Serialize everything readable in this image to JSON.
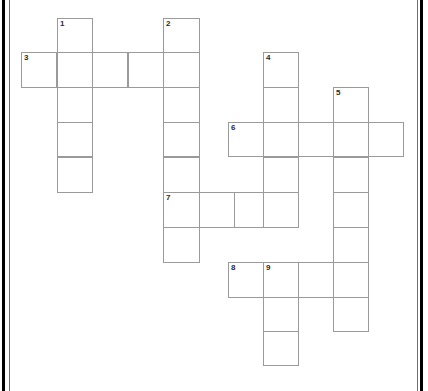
{
  "page": {
    "background_color": "#ffffff",
    "border_color": "#000000",
    "cell_border_color": "#9a9a9a",
    "number_color": "#2b2b2b",
    "width": 428,
    "height": 391
  },
  "crossword": {
    "cell_size": 35.5,
    "origin": {
      "x": 21,
      "y": 18
    },
    "clue_numbers": [
      "1",
      "2",
      "3",
      "4",
      "5",
      "6",
      "7",
      "8",
      "9"
    ],
    "entries": [
      {
        "number": "1",
        "direction": "down",
        "length": 5,
        "start": {
          "x": 57,
          "y": 18
        }
      },
      {
        "number": "2",
        "direction": "down",
        "length": 7,
        "start": {
          "x": 163,
          "y": 18
        }
      },
      {
        "number": "3",
        "direction": "across",
        "length": 5,
        "start": {
          "x": 21,
          "y": 52
        }
      },
      {
        "number": "4",
        "direction": "down",
        "length": 5,
        "start": {
          "x": 263,
          "y": 52
        }
      },
      {
        "number": "5",
        "direction": "down",
        "length": 7,
        "start": {
          "x": 333,
          "y": 87
        }
      },
      {
        "number": "6",
        "direction": "across",
        "length": 5,
        "start": {
          "x": 228,
          "y": 122
        }
      },
      {
        "number": "7",
        "direction": "across",
        "length": 4,
        "start": {
          "x": 163,
          "y": 192
        }
      },
      {
        "number": "8",
        "direction": "across",
        "length": 4,
        "start": {
          "x": 228,
          "y": 262
        }
      },
      {
        "number": "9",
        "direction": "down",
        "length": 3,
        "start": {
          "x": 263,
          "y": 262
        }
      }
    ],
    "cells": [
      {
        "x": 57,
        "y": 18,
        "w": 36,
        "h": 35,
        "num": "1"
      },
      {
        "x": 163,
        "y": 18,
        "w": 37,
        "h": 35,
        "num": "2"
      },
      {
        "x": 21,
        "y": 52,
        "w": 36,
        "h": 36,
        "num": "3"
      },
      {
        "x": 57,
        "y": 52,
        "w": 36,
        "h": 36,
        "num": ""
      },
      {
        "x": 92,
        "y": 52,
        "w": 36,
        "h": 36,
        "num": ""
      },
      {
        "x": 128,
        "y": 52,
        "w": 36,
        "h": 36,
        "num": ""
      },
      {
        "x": 163,
        "y": 52,
        "w": 37,
        "h": 36,
        "num": ""
      },
      {
        "x": 263,
        "y": 52,
        "w": 36,
        "h": 36,
        "num": "4"
      },
      {
        "x": 57,
        "y": 87,
        "w": 36,
        "h": 36,
        "num": ""
      },
      {
        "x": 163,
        "y": 87,
        "w": 37,
        "h": 36,
        "num": ""
      },
      {
        "x": 263,
        "y": 87,
        "w": 36,
        "h": 36,
        "num": ""
      },
      {
        "x": 333,
        "y": 87,
        "w": 36,
        "h": 36,
        "num": "5"
      },
      {
        "x": 57,
        "y": 122,
        "w": 36,
        "h": 35,
        "num": ""
      },
      {
        "x": 163,
        "y": 122,
        "w": 37,
        "h": 35,
        "num": ""
      },
      {
        "x": 228,
        "y": 122,
        "w": 36,
        "h": 35,
        "num": "6"
      },
      {
        "x": 263,
        "y": 122,
        "w": 36,
        "h": 35,
        "num": ""
      },
      {
        "x": 298,
        "y": 122,
        "w": 36,
        "h": 35,
        "num": ""
      },
      {
        "x": 333,
        "y": 122,
        "w": 36,
        "h": 35,
        "num": ""
      },
      {
        "x": 368,
        "y": 122,
        "w": 36,
        "h": 35,
        "num": ""
      },
      {
        "x": 57,
        "y": 157,
        "w": 36,
        "h": 36,
        "num": ""
      },
      {
        "x": 163,
        "y": 157,
        "w": 37,
        "h": 36,
        "num": ""
      },
      {
        "x": 263,
        "y": 157,
        "w": 36,
        "h": 36,
        "num": ""
      },
      {
        "x": 333,
        "y": 157,
        "w": 36,
        "h": 36,
        "num": ""
      },
      {
        "x": 163,
        "y": 192,
        "w": 37,
        "h": 36,
        "num": "7"
      },
      {
        "x": 199,
        "y": 192,
        "w": 36,
        "h": 36,
        "num": ""
      },
      {
        "x": 234,
        "y": 192,
        "w": 36,
        "h": 36,
        "num": ""
      },
      {
        "x": 263,
        "y": 192,
        "w": 36,
        "h": 36,
        "num": ""
      },
      {
        "x": 333,
        "y": 192,
        "w": 36,
        "h": 36,
        "num": ""
      },
      {
        "x": 163,
        "y": 227,
        "w": 37,
        "h": 36,
        "num": ""
      },
      {
        "x": 333,
        "y": 227,
        "w": 36,
        "h": 36,
        "num": ""
      },
      {
        "x": 228,
        "y": 262,
        "w": 36,
        "h": 36,
        "num": "8"
      },
      {
        "x": 263,
        "y": 262,
        "w": 36,
        "h": 36,
        "num": "9"
      },
      {
        "x": 298,
        "y": 262,
        "w": 36,
        "h": 36,
        "num": ""
      },
      {
        "x": 333,
        "y": 262,
        "w": 36,
        "h": 36,
        "num": ""
      },
      {
        "x": 263,
        "y": 297,
        "w": 36,
        "h": 35,
        "num": ""
      },
      {
        "x": 333,
        "y": 297,
        "w": 36,
        "h": 35,
        "num": ""
      },
      {
        "x": 263,
        "y": 331,
        "w": 36,
        "h": 35,
        "num": ""
      }
    ]
  }
}
